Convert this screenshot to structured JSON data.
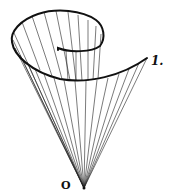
{
  "diagram": {
    "labels": {
      "apex": "O",
      "spiral_end": "1."
    },
    "colors": {
      "stroke": "#111111",
      "background": "#ffffff"
    }
  }
}
